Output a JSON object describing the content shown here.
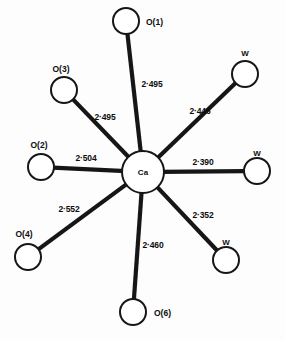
{
  "figure": {
    "type": "coordination-polyhedron-diagram",
    "center_atom": {
      "label": "Ca",
      "cx": 143,
      "cy": 172,
      "r": 21
    },
    "ink_color": "#161616",
    "background_color": "#fdfdfd",
    "ligands": [
      {
        "id": "o1",
        "label": "O(1)",
        "bond_length": "2·495",
        "cx": 126,
        "cy": 21,
        "r": 13,
        "label_x": 146,
        "label_y": 25,
        "bond_label_x": 152,
        "bond_label_y": 87
      },
      {
        "id": "w1",
        "label": "W",
        "bond_length": "2·446",
        "cx": 245,
        "cy": 74,
        "r": 13,
        "label_x": 245,
        "label_y": 56,
        "bond_label_x": 200,
        "bond_label_y": 114
      },
      {
        "id": "w2",
        "label": "W",
        "bond_length": "2·390",
        "cx": 257,
        "cy": 171,
        "r": 13,
        "label_x": 257,
        "label_y": 156,
        "bond_label_x": 203,
        "bond_label_y": 165
      },
      {
        "id": "w3",
        "label": "W",
        "bond_length": "2·352",
        "cx": 226,
        "cy": 260,
        "r": 13,
        "label_x": 226,
        "label_y": 245,
        "bond_label_x": 203,
        "bond_label_y": 218
      },
      {
        "id": "o6",
        "label": "O(6)",
        "bond_length": "2·460",
        "cx": 133,
        "cy": 312,
        "r": 13,
        "label_x": 154,
        "label_y": 316,
        "bond_label_x": 153,
        "bond_label_y": 248
      },
      {
        "id": "o4",
        "label": "O(4)",
        "bond_length": "2·552",
        "cx": 28,
        "cy": 257,
        "r": 13,
        "label_x": 24,
        "label_y": 237,
        "bond_label_x": 69,
        "bond_label_y": 212
      },
      {
        "id": "o2",
        "label": "O(2)",
        "bond_length": "2·504",
        "cx": 41,
        "cy": 167,
        "r": 13,
        "label_x": 39,
        "label_y": 148,
        "bond_label_x": 86,
        "bond_label_y": 161
      },
      {
        "id": "o3",
        "label": "O(3)",
        "bond_length": "2·495",
        "cx": 64,
        "cy": 90,
        "r": 13,
        "label_x": 61,
        "label_y": 72,
        "bond_label_x": 105,
        "bond_label_y": 120
      }
    ]
  }
}
